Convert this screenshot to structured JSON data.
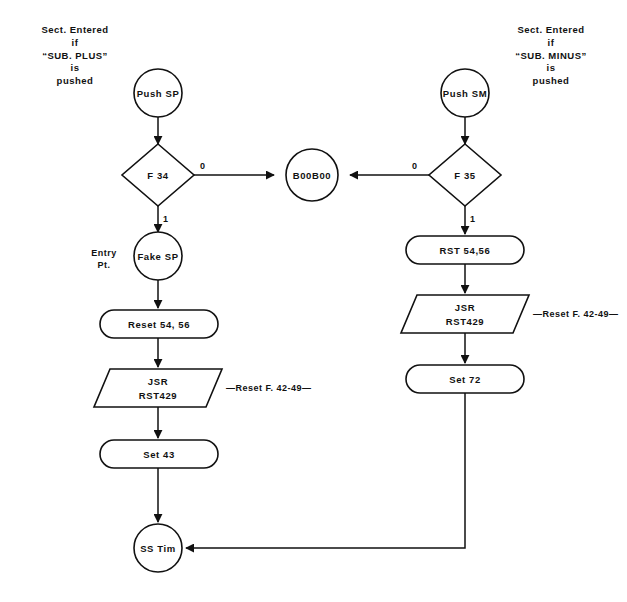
{
  "diagram": {
    "colors": {
      "stroke": "#111111",
      "background": "#ffffff",
      "text": "#111111"
    },
    "notes": {
      "left": {
        "line1": "Sect. Entered",
        "line2": "if",
        "line3": "“SUB. PLUS”",
        "line4": "is",
        "line5": "pushed"
      },
      "right": {
        "line1": "Sect. Entered",
        "line2": "if",
        "line3": "“SUB. MINUS”",
        "line4": "is",
        "line5": "pushed"
      },
      "entry_point": {
        "line1": "Entry",
        "line2": "Pt."
      }
    },
    "nodes": {
      "push_sp": {
        "label": "Push SP",
        "shape": "circle"
      },
      "f34": {
        "label": "F 34",
        "shape": "diamond"
      },
      "fake_sp": {
        "label": "Fake SP",
        "shape": "circle"
      },
      "reset_54_56": {
        "label": "Reset 54, 56",
        "shape": "stadium"
      },
      "jsr_left": {
        "line1": "JSR",
        "line2": "RST429",
        "shape": "parallelogram"
      },
      "set_43": {
        "label": "Set 43",
        "shape": "stadium"
      },
      "ss_tim": {
        "label": "SS Tim",
        "shape": "circle"
      },
      "b00b00": {
        "label": "B00B00",
        "shape": "circle"
      },
      "push_sm": {
        "label": "Push SM",
        "shape": "circle"
      },
      "f35": {
        "label": "F 35",
        "shape": "diamond"
      },
      "rst_54_56": {
        "label": "RST 54,56",
        "shape": "stadium"
      },
      "jsr_right": {
        "line1": "JSR",
        "line2": "RST429",
        "shape": "parallelogram"
      },
      "set_72": {
        "label": "Set 72",
        "shape": "stadium"
      }
    },
    "edge_labels": {
      "f34_zero": "0",
      "f34_one": "1",
      "f35_zero": "0",
      "f35_one": "1"
    },
    "annotations": {
      "reset_flags_left": "—Reset F. 42-49—",
      "reset_flags_right": "—Reset F. 42-49—"
    }
  }
}
